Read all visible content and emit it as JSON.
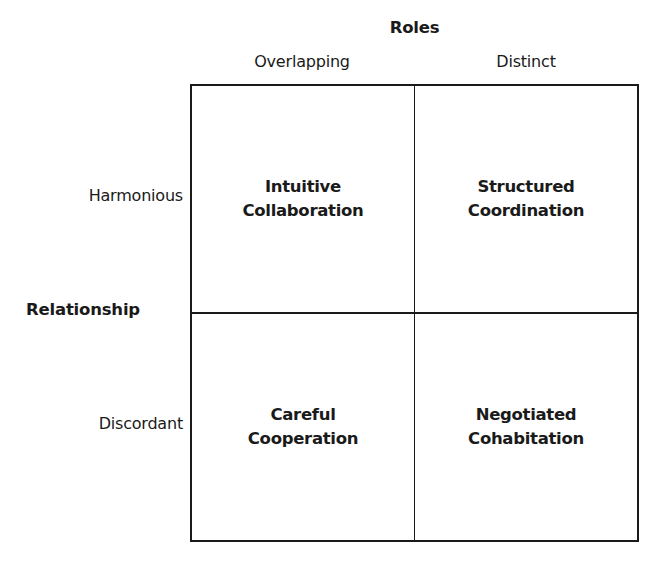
{
  "diagram": {
    "type": "2x2 matrix",
    "column_axis": {
      "title": "Roles",
      "labels": [
        "Overlapping",
        "Distinct"
      ]
    },
    "row_axis": {
      "title": "Relationship",
      "labels": [
        "Harmonious",
        "Discordant"
      ]
    },
    "cells": [
      {
        "row": "Harmonious",
        "column": "Overlapping",
        "lines": [
          "Intuitive",
          "Collaboration"
        ]
      },
      {
        "row": "Harmonious",
        "column": "Distinct",
        "lines": [
          "Structured",
          "Coordination"
        ]
      },
      {
        "row": "Discordant",
        "column": "Overlapping",
        "lines": [
          "Careful",
          "Cooperation"
        ]
      },
      {
        "row": "Discordant",
        "column": "Distinct",
        "lines": [
          "Negotiated",
          "Cohabitation"
        ]
      }
    ],
    "colors": {
      "line": "#1a1a1a",
      "text": "#1a1a1a",
      "background": "#ffffff"
    }
  }
}
